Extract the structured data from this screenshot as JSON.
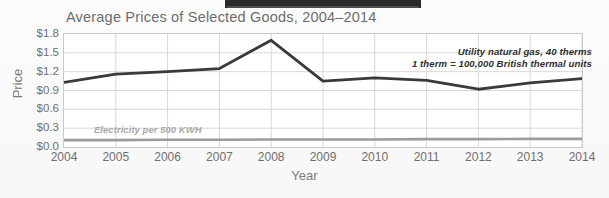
{
  "figure": {
    "title": "Average Prices of Selected Goods, 2004–2014",
    "xlabel": "Year",
    "ylabel": "Price"
  },
  "annotations": {
    "gas_line1": "Utility natural gas,  40 therms",
    "gas_line2": "1 therm = 100,000 British thermal units",
    "electricity": "Electricity per 500 KWH"
  },
  "colors": {
    "gas_line": "#3a3a3a",
    "electricity_line": "#9b9b9b",
    "grid": "#d8d8d8",
    "plot_border": "#c9c9c9",
    "title_text": "#6d6d6d",
    "tick_text": "#6f6f6f",
    "top_bar": "#2b2b2b"
  },
  "chart_data": {
    "type": "line",
    "title": "Average Prices of Selected Goods, 2004–2014",
    "xlabel": "Year",
    "ylabel": "Price",
    "x": [
      2004,
      2005,
      2006,
      2007,
      2008,
      2009,
      2010,
      2011,
      2012,
      2013,
      2014
    ],
    "xtick_labels": [
      "2004",
      "2005",
      "2006",
      "2007",
      "2008",
      "2009",
      "2010",
      "2011",
      "2012",
      "2013",
      "2014"
    ],
    "ytick_labels": [
      "$0.0",
      "$0.3",
      "$0.6",
      "$0.9",
      "$1.2",
      "$1.5",
      "$1.8"
    ],
    "ytick_values": [
      0.0,
      0.3,
      0.6,
      0.9,
      1.2,
      1.5,
      1.8
    ],
    "ylim": [
      0.0,
      1.8
    ],
    "xlim": [
      2004,
      2014
    ],
    "grid": true,
    "legend": "none",
    "series": [
      {
        "name": "Utility natural gas, 40 therms",
        "color": "#3a3a3a",
        "values": [
          1.03,
          1.16,
          1.2,
          1.25,
          1.7,
          1.05,
          1.1,
          1.06,
          0.92,
          1.02,
          1.09
        ]
      },
      {
        "name": "Electricity per 500 KWH",
        "color": "#9b9b9b",
        "values": [
          0.11,
          0.11,
          0.115,
          0.115,
          0.12,
          0.12,
          0.12,
          0.125,
          0.125,
          0.13,
          0.13
        ]
      }
    ]
  }
}
